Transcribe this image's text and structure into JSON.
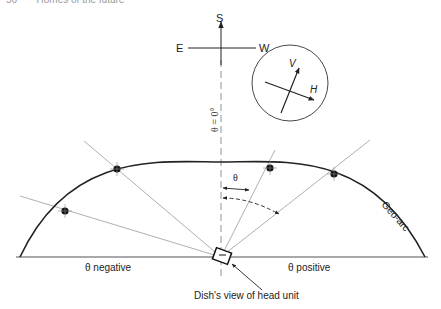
{
  "header": {
    "page_number": "56",
    "title": "Homes of the future"
  },
  "diagram": {
    "compass": {
      "south": "S",
      "east": "E",
      "west": "W"
    },
    "polarisation_inset": {
      "vertical": "V",
      "horizontal": "H"
    },
    "zero_angle_label": "θ = 0°",
    "theta_label": "θ",
    "arc_label": "Geo-arc",
    "negative_label": "θ negative",
    "positive_label": "θ positive",
    "dish_caption": "Dish's view of head unit",
    "satellites": 4,
    "colors": {
      "line": "#222222",
      "sightline": "#9a9a9a",
      "background": "#ffffff"
    }
  }
}
